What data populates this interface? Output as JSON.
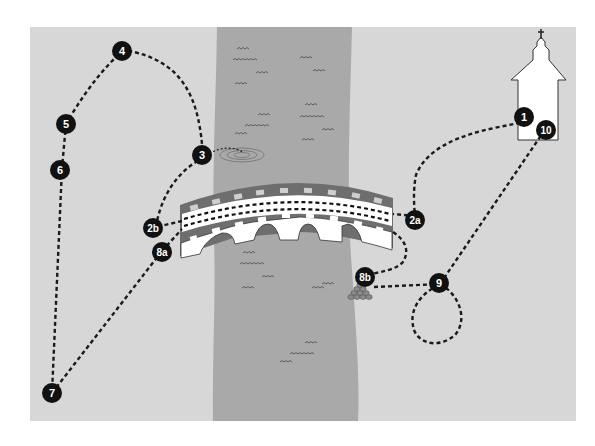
{
  "map": {
    "title": "Route map",
    "colors": {
      "land": "#d7d7d7",
      "river": "#a9a9a9",
      "bridge_dark": "#6e6e6e",
      "bridge_light": "#ffffff",
      "marker_fill": "#111111",
      "marker_text": "#ffffff",
      "path": "#1a1a1a",
      "background": "#ffffff"
    },
    "landmarks": [
      {
        "id": "church",
        "label": "church"
      },
      {
        "id": "bridge",
        "label": "bridge"
      },
      {
        "id": "ripple",
        "label": "water ripple"
      },
      {
        "id": "stones",
        "label": "pile of stones"
      },
      {
        "id": "river",
        "label": "river"
      }
    ],
    "markers": [
      {
        "id": "m1",
        "label": "1"
      },
      {
        "id": "m2a",
        "label": "2a"
      },
      {
        "id": "m2b",
        "label": "2b"
      },
      {
        "id": "m3",
        "label": "3"
      },
      {
        "id": "m4",
        "label": "4"
      },
      {
        "id": "m5",
        "label": "5"
      },
      {
        "id": "m6",
        "label": "6"
      },
      {
        "id": "m7",
        "label": "7"
      },
      {
        "id": "m8a",
        "label": "8a"
      },
      {
        "id": "m8b",
        "label": "8b"
      },
      {
        "id": "m9",
        "label": "9"
      },
      {
        "id": "m10",
        "label": "10"
      }
    ]
  }
}
